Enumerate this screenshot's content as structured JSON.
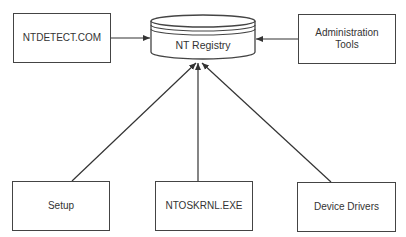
{
  "diagram": {
    "center": {
      "id": "registry",
      "label": "NT Registry",
      "shape": "cylinder"
    },
    "nodes": [
      {
        "id": "ntdetect",
        "label": "NTDETECT.COM",
        "x": 13,
        "y": 13,
        "w": 98,
        "h": 50
      },
      {
        "id": "admin",
        "label": "Administration\nTools",
        "x": 298,
        "y": 14,
        "w": 98,
        "h": 50
      },
      {
        "id": "setup",
        "label": "Setup",
        "x": 12,
        "y": 181,
        "w": 98,
        "h": 50
      },
      {
        "id": "ntoskrnl",
        "label": "NTOSKRNL.EXE",
        "x": 155,
        "y": 181,
        "w": 98,
        "h": 50
      },
      {
        "id": "drivers",
        "label": "Device Drivers",
        "x": 297,
        "y": 182,
        "w": 99,
        "h": 50
      }
    ],
    "edges": [
      {
        "from": "ntdetect",
        "to": "registry"
      },
      {
        "from": "admin",
        "to": "registry"
      },
      {
        "from": "setup",
        "to": "registry"
      },
      {
        "from": "ntoskrnl",
        "to": "registry"
      },
      {
        "from": "drivers",
        "to": "registry"
      }
    ],
    "colors": {
      "stroke": "#444444",
      "text": "#333333",
      "background": "#ffffff"
    }
  }
}
